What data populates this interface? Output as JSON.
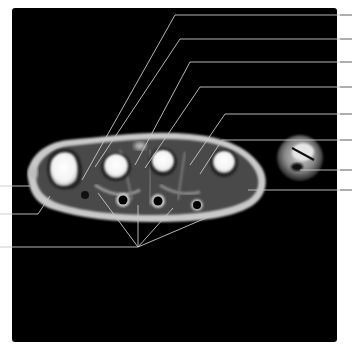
{
  "figure": {
    "frame_color": "#000000",
    "background_color": "#ffffff",
    "leader_line_color": "#c8c8c8",
    "leader_lines": {
      "right": [
        {
          "y": 15,
          "target": [
            82,
            180
          ],
          "knee": [
            175,
            15
          ]
        },
        {
          "y": 39,
          "target": [
            95,
            167
          ],
          "knee": [
            180,
            39
          ]
        },
        {
          "y": 62,
          "target": [
            135,
            165
          ],
          "knee": [
            190,
            62
          ]
        },
        {
          "y": 87,
          "target": [
            145,
            168
          ],
          "knee": [
            200,
            87
          ]
        },
        {
          "y": 114,
          "target": [
            190,
            165
          ],
          "knee": [
            225,
            114
          ]
        },
        {
          "y": 140,
          "target": [
            200,
            174
          ],
          "knee": [
            222,
            140
          ]
        },
        {
          "y": 170,
          "target": [
            300,
            170
          ]
        },
        {
          "y": 190,
          "target": [
            248,
            190
          ]
        }
      ],
      "left": [
        {
          "y": 186,
          "target": [
            30,
            186
          ]
        },
        {
          "y": 214,
          "target": [
            50,
            196
          ],
          "knee": [
            38,
            214
          ]
        },
        {
          "y": 247,
          "converge": [
            138,
            247
          ],
          "fan_targets": [
            [
              98,
              193
            ],
            [
              138,
              205
            ],
            [
              173,
              208
            ],
            [
              213,
              215
            ]
          ]
        }
      ]
    },
    "labels": []
  }
}
